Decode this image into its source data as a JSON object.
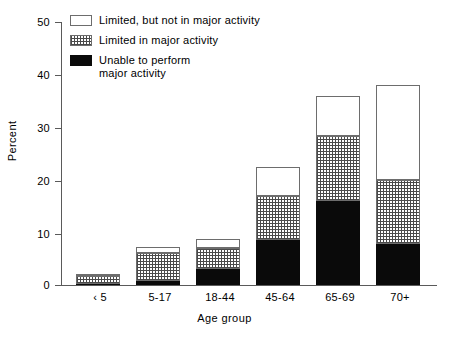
{
  "chart_data": {
    "type": "bar",
    "subtype": "stacked",
    "title": "",
    "xlabel": "Age group",
    "ylabel": "Percent",
    "ylim": [
      0,
      50
    ],
    "yticks": [
      0,
      10,
      20,
      30,
      40,
      50
    ],
    "grid": false,
    "legend_position": "top-left",
    "categories": [
      "‹ 5",
      "5-17",
      "18-44",
      "45-64",
      "65-69",
      "70+"
    ],
    "series": [
      {
        "name": "Unable to perform major activity",
        "fill": "black",
        "values": [
          0.2,
          0.7,
          3.0,
          8.5,
          16.0,
          7.8
        ]
      },
      {
        "name": "Limited in major activity",
        "fill": "dotted",
        "values": [
          1.5,
          5.3,
          4.0,
          8.5,
          12.3,
          12.2
        ]
      },
      {
        "name": "Limited, but not in major activity",
        "fill": "white",
        "values": [
          0.3,
          1.3,
          1.7,
          5.5,
          7.7,
          18.0
        ]
      }
    ],
    "totals": [
      2.0,
      7.3,
      8.7,
      22.5,
      36.0,
      38.0
    ]
  },
  "axes": {
    "y_label": "Percent",
    "x_label": "Age group",
    "y_tick_labels": [
      "50",
      "40",
      "30",
      "20",
      "10",
      "0"
    ],
    "x_tick_labels": [
      "‹ 5",
      "5-17",
      "18-44",
      "45-64",
      "65-69",
      "70+"
    ]
  },
  "legend": {
    "items": [
      {
        "swatch": "white-swatch",
        "label": "Limited, but not in major activity"
      },
      {
        "swatch": "dotted-swatch",
        "label": "Limited in major activity"
      },
      {
        "swatch": "black-swatch",
        "label": "Unable to perform\n    major activity"
      }
    ]
  }
}
